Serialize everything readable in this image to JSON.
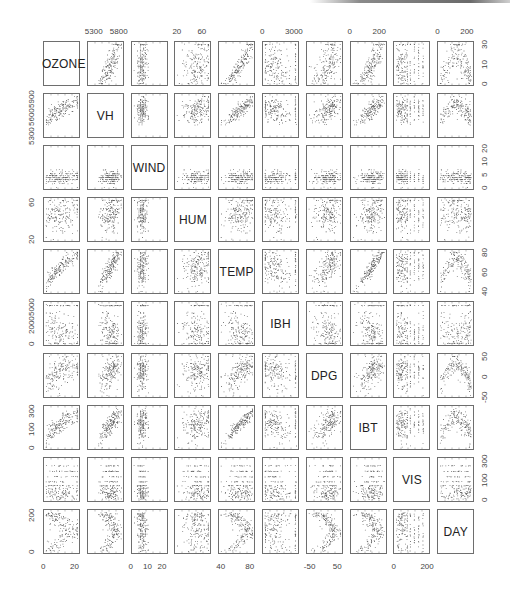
{
  "chart_data": {
    "type": "scatter-matrix",
    "title": "",
    "variables": [
      "OZONE",
      "VH",
      "WIND",
      "HUM",
      "TEMP",
      "IBH",
      "DPG",
      "IBT",
      "VIS",
      "DAY"
    ],
    "n_points_per_panel": 180,
    "grid": false,
    "axis_ticks": {
      "top": [
        {
          "col": 1,
          "labels": [
            "5300",
            "5800"
          ]
        },
        {
          "col": 3,
          "labels": [
            "20",
            "60"
          ]
        },
        {
          "col": 5,
          "labels": [
            "0",
            "3000"
          ]
        },
        {
          "col": 7,
          "labels": [
            "0",
            "200"
          ]
        },
        {
          "col": 9,
          "labels": [
            "0",
            "200"
          ]
        }
      ],
      "bottom": [
        {
          "col": 0,
          "labels": [
            "0",
            "20"
          ]
        },
        {
          "col": 2,
          "labels": [
            "0",
            "10",
            "20"
          ]
        },
        {
          "col": 4,
          "labels": [
            "40",
            "80"
          ]
        },
        {
          "col": 6,
          "labels": [
            "-50",
            "50"
          ]
        },
        {
          "col": 8,
          "labels": [
            "0",
            "200"
          ]
        }
      ],
      "left": [
        {
          "row": 1,
          "labels": [
            "5300",
            "5600",
            "5900"
          ]
        },
        {
          "row": 3,
          "labels": [
            "20",
            "60"
          ]
        },
        {
          "row": 5,
          "labels": [
            "0",
            "2000",
            "5000"
          ]
        },
        {
          "row": 7,
          "labels": [
            "0",
            "100",
            "300"
          ]
        },
        {
          "row": 9,
          "labels": [
            "0",
            "200"
          ]
        }
      ],
      "right": [
        {
          "row": 0,
          "labels": [
            "0",
            "10",
            "30"
          ]
        },
        {
          "row": 2,
          "labels": [
            "0",
            "5",
            "10",
            "20"
          ]
        },
        {
          "row": 4,
          "labels": [
            "40",
            "60",
            "80"
          ]
        },
        {
          "row": 6,
          "labels": [
            "-50",
            "0",
            "50"
          ]
        },
        {
          "row": 8,
          "labels": [
            "0",
            "100",
            "300"
          ]
        }
      ]
    },
    "ranges": {
      "OZONE": [
        0,
        38
      ],
      "VH": [
        5300,
        5950
      ],
      "WIND": [
        0,
        21
      ],
      "HUM": [
        19,
        93
      ],
      "TEMP": [
        25,
        93
      ],
      "IBH": [
        100,
        5000
      ],
      "DPG": [
        -69,
        107
      ],
      "IBT": [
        -25,
        332
      ],
      "VIS": [
        0,
        350
      ],
      "DAY": [
        1,
        365
      ]
    },
    "variable_profile": {
      "OZONE": {
        "dist": "skew",
        "relations": {
          "VH": 0.6,
          "HUM": 0.45,
          "TEMP": 0.78,
          "IBH": -0.58,
          "IBT": 0.74,
          "VIS": -0.44,
          "DAY": "arch"
        }
      },
      "VH": {
        "dist": "leftskew"
      },
      "WIND": {
        "dist": "discrete-low"
      },
      "HUM": {
        "dist": "leftskew"
      },
      "TEMP": {
        "dist": "normal"
      },
      "IBH": {
        "dist": "bimodal-top"
      },
      "DPG": {
        "dist": "normal"
      },
      "IBT": {
        "dist": "normal"
      },
      "VIS": {
        "dist": "discrete-levels"
      },
      "DAY": {
        "dist": "uniform"
      }
    }
  }
}
